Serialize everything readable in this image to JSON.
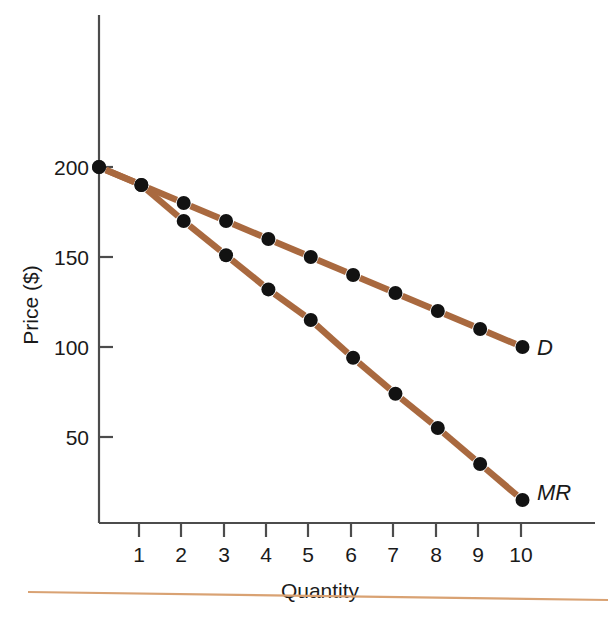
{
  "chart_data": {
    "type": "line",
    "title": "",
    "xlabel": "Quantity",
    "ylabel": "Price ($)",
    "xlim": [
      0,
      10.8
    ],
    "ylim": [
      0,
      230
    ],
    "xticks": [
      1,
      2,
      3,
      4,
      5,
      6,
      7,
      8,
      9,
      10
    ],
    "yticks": [
      50,
      100,
      150,
      200
    ],
    "xtick_labels": [
      "1",
      "2",
      "3",
      "4",
      "5",
      "6",
      "7",
      "8",
      "9",
      "10"
    ],
    "ytick_labels": [
      "50",
      "100",
      "150",
      "200"
    ],
    "grid": false,
    "legend_position": "inline-right-end",
    "line_color": "#A9693F",
    "marker_color": "#121212",
    "axis_color": "#4c4c4c",
    "footer_rule_color": "#D9A273",
    "series": [
      {
        "name": "D",
        "label": "D",
        "description": "Demand curve",
        "x": [
          0,
          1,
          2,
          3,
          4,
          5,
          6,
          7,
          8,
          9,
          10
        ],
        "values": [
          200,
          190,
          180,
          170,
          160,
          150,
          140,
          130,
          120,
          110,
          100
        ]
      },
      {
        "name": "MR",
        "label": "MR",
        "description": "Marginal revenue curve",
        "x": [
          0,
          1,
          2,
          3,
          4,
          5,
          6,
          7,
          8,
          9,
          10
        ],
        "values": [
          200,
          190,
          170,
          151,
          132,
          115,
          94,
          74,
          55,
          35,
          15
        ]
      }
    ]
  },
  "labels": {
    "y_axis_title": "Price ($)",
    "x_axis_title": "Quantity",
    "demand_label": "D",
    "marginal_revenue_label": "MR"
  },
  "ticks": {
    "y": [
      "200",
      "150",
      "100",
      "50"
    ],
    "x": [
      "1",
      "2",
      "3",
      "4",
      "5",
      "6",
      "7",
      "8",
      "9",
      "10"
    ]
  }
}
